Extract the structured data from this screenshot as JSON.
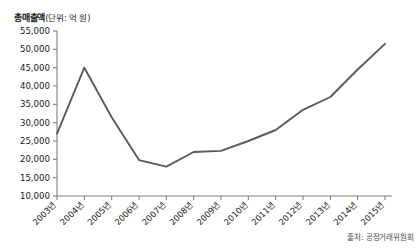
{
  "figure": {
    "axis_title": "총매출액",
    "axis_title_unit": "(단위: 억 원)",
    "source_note": "출처: 공정거래위원회"
  },
  "chart_data": {
    "type": "line",
    "title": "총매출액(단위: 억 원)",
    "xlabel": "",
    "ylabel": "총매출액 (억 원)",
    "unit": "억 원",
    "source": "출처: 공정거래위원회",
    "grid": false,
    "legend": "none",
    "ylim": [
      10000,
      55000
    ],
    "ytick_step": 5000,
    "ytick_labels": [
      "10,000",
      "15,000",
      "20,000",
      "25,000",
      "30,000",
      "35,000",
      "40,000",
      "45,000",
      "50,000",
      "55,000"
    ],
    "ytick_values": [
      10000,
      15000,
      20000,
      25000,
      30000,
      35000,
      40000,
      45000,
      50000,
      55000
    ],
    "categories": [
      "2003년",
      "2004년",
      "2005년",
      "2006년",
      "2007년",
      "2008년",
      "2009년",
      "2010년",
      "2011년",
      "2012년",
      "2013년",
      "2014년",
      "2015년"
    ],
    "values": [
      27000,
      45000,
      31500,
      19800,
      18000,
      22000,
      22300,
      25000,
      28000,
      33500,
      37000,
      44500,
      51500
    ],
    "series": [
      {
        "name": "총매출액",
        "color": "#5a5a5a",
        "values": [
          27000,
          45000,
          31500,
          19800,
          18000,
          22000,
          22300,
          25000,
          28000,
          33500,
          37000,
          44500,
          51500
        ]
      }
    ]
  }
}
